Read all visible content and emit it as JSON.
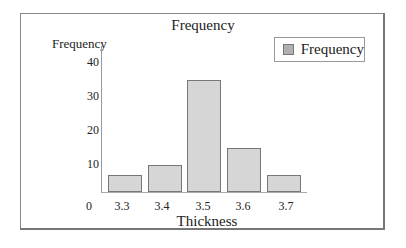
{
  "chart_data": {
    "type": "bar",
    "title": "Frequency",
    "xlabel": "Thickness",
    "ylabel": "Frequency",
    "categories": [
      "3.3",
      "3.4",
      "3.5",
      "3.6",
      "3.7"
    ],
    "series": [
      {
        "name": "Frequency",
        "values": [
          5,
          8,
          33,
          13,
          5
        ]
      }
    ],
    "ylim": [
      0,
      40
    ],
    "yticks": [
      "10",
      "20",
      "30",
      "40"
    ],
    "origin_label": "0",
    "grid": false,
    "legend_position": "top-right",
    "bar_color": "#d6d6d6"
  },
  "legend": {
    "label": "Frequency"
  }
}
